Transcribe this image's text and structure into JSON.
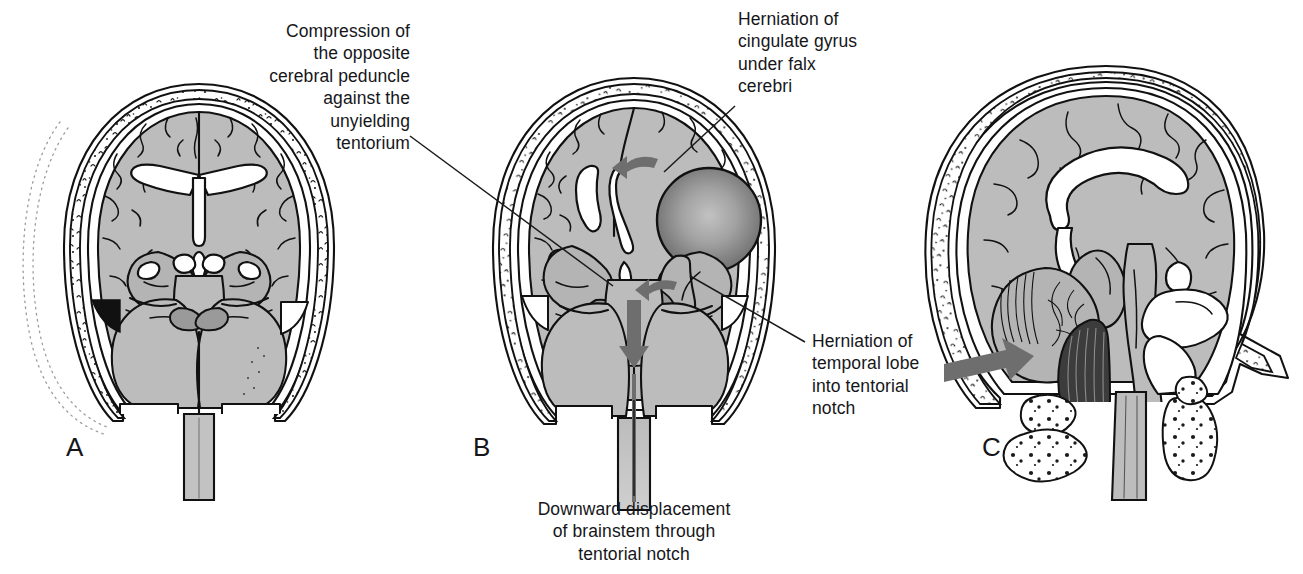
{
  "figure": {
    "background_color": "#ffffff",
    "width": 1303,
    "height": 574
  },
  "palette": {
    "brain_gray": "#bcbcbc",
    "brain_gray_dark": "#9a9a9a",
    "bone_white": "#ffffff",
    "ink_black": "#111111",
    "arrow_gray": "#6e6e6e",
    "tonsil_dark": "#3c3c3c",
    "mass_center": "#b4b4b4",
    "mass_edge": "#6f6f6f"
  },
  "panels": [
    {
      "id": "A",
      "label": "A",
      "view": "coronal",
      "description": "Normal coronal section of brain within skull"
    },
    {
      "id": "B",
      "label": "B",
      "view": "coronal",
      "description": "Coronal section with expanding mass lesion causing herniation"
    },
    {
      "id": "C",
      "label": "C",
      "view": "midsagittal",
      "description": "Midsagittal section showing tonsillar herniation through foramen magnum"
    }
  ],
  "callouts": [
    {
      "id": "compression-peduncle",
      "text": "Compression of\nthe opposite\ncerebral peduncle\nagainst the\nunyielding\ntentorium",
      "align": "right",
      "panel": "B"
    },
    {
      "id": "cingulate-herniation",
      "text": "Herniation of\ncingulate gyrus\nunder falx\ncerebri",
      "align": "left",
      "panel": "B"
    },
    {
      "id": "temporal-herniation",
      "text": "Herniation of\ntemporal lobe\ninto tentorial\nnotch",
      "align": "left",
      "panel": "B"
    },
    {
      "id": "brainstem-displacement",
      "text": "Downward displacement\nof brainstem through\ntentorial notch",
      "align": "center",
      "panel": "B"
    }
  ],
  "markers": [
    {
      "id": "cingulate-arrow",
      "type": "curved-arrow",
      "direction": "left",
      "panel": "B"
    },
    {
      "id": "uncal-arrow",
      "type": "curved-arrow",
      "direction": "left",
      "panel": "B"
    },
    {
      "id": "brainstem-arrow",
      "type": "straight-arrow",
      "direction": "down",
      "panel": "B"
    },
    {
      "id": "tonsillar-arrow",
      "type": "straight-arrow",
      "direction": "right",
      "panel": "C"
    }
  ]
}
